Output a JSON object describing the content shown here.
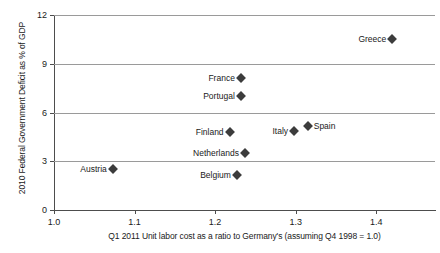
{
  "chart_data": {
    "type": "scatter",
    "title": "",
    "xlabel": "Q1 2011 Unit labor cost as a ratio to Germany's (assuming Q4 1998 = 1.0)",
    "ylabel": "2010 Federal Government Deficit as % of GDP",
    "xlim": [
      1.0,
      1.473
    ],
    "ylim": [
      0,
      12
    ],
    "xticks": [
      "1.0",
      "1.1",
      "1.2",
      "1.3",
      "1.4"
    ],
    "xtick_values": [
      1.0,
      1.1,
      1.2,
      1.3,
      1.4
    ],
    "yticks": [
      "0",
      "3",
      "6",
      "9",
      "12"
    ],
    "ytick_values": [
      0,
      3,
      6,
      9,
      12
    ],
    "grid": "horizontal",
    "gridlines": [
      3,
      6,
      9,
      12
    ],
    "legend": "none",
    "marker": "diamond",
    "marker_color": "#3c3c3c",
    "axis_color": "#4d4d4d",
    "grid_color": "#9a9a9a",
    "points": [
      {
        "label": "Greece",
        "x": 1.42,
        "y": 10.5,
        "label_side": "left"
      },
      {
        "label": "France",
        "x": 1.232,
        "y": 8.1,
        "label_side": "left"
      },
      {
        "label": "Portugal",
        "x": 1.232,
        "y": 7.0,
        "label_side": "left"
      },
      {
        "label": "Spain",
        "x": 1.315,
        "y": 5.2,
        "label_side": "right"
      },
      {
        "label": "Italy",
        "x": 1.298,
        "y": 4.85,
        "label_side": "left"
      },
      {
        "label": "Finland",
        "x": 1.218,
        "y": 4.8,
        "label_side": "left"
      },
      {
        "label": "Netherlands",
        "x": 1.237,
        "y": 3.5,
        "label_side": "left"
      },
      {
        "label": "Austria",
        "x": 1.073,
        "y": 2.5,
        "label_side": "left"
      },
      {
        "label": "Belgium",
        "x": 1.227,
        "y": 2.15,
        "label_side": "left"
      }
    ]
  }
}
